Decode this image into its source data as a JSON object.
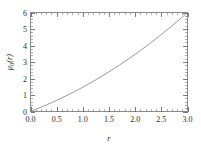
{
  "chart_data": {
    "type": "line",
    "title": "",
    "subtitle": "",
    "xlabel": "r",
    "ylabel": "μ₀(r)",
    "ylabel_base": "μ",
    "ylabel_subscript": "0",
    "ylabel_arg": "(r)",
    "xlim": [
      0,
      3
    ],
    "ylim": [
      0,
      6
    ],
    "grid": false,
    "legend": "none",
    "frame": true,
    "tick_direction": "in",
    "xticks": [
      0,
      0.5,
      1,
      1.5,
      2,
      2.5,
      3
    ],
    "xtick_labels": [
      "0.0",
      "0.5",
      "1.0",
      "1.5",
      "2.0",
      "2.5",
      "3.0"
    ],
    "yticks": [
      0,
      1,
      2,
      3,
      4,
      5,
      6
    ],
    "ytick_labels": [
      "0",
      "1",
      "2",
      "3",
      "4",
      "5",
      "6"
    ],
    "x_minor_per_interval": 5,
    "y_minor_per_interval": 5,
    "series": [
      {
        "name": "mu0",
        "color": "#8c8c8c",
        "x": [
          0.0,
          0.1,
          0.2,
          0.3,
          0.4,
          0.5,
          0.6,
          0.7,
          0.8,
          0.9,
          1.0,
          1.1,
          1.2,
          1.3,
          1.4,
          1.5,
          1.6,
          1.7,
          1.8,
          1.9,
          2.0,
          2.1,
          2.2,
          2.3,
          2.4,
          2.5,
          2.6,
          2.7,
          2.8,
          2.9,
          3.0
        ],
        "y": [
          0.0,
          0.16,
          0.33,
          0.5,
          0.68,
          0.86,
          1.05,
          1.25,
          1.45,
          1.66,
          1.88,
          2.1,
          2.33,
          2.57,
          2.81,
          3.06,
          3.32,
          3.58,
          3.85,
          4.13,
          4.41,
          4.7,
          5.0,
          5.3,
          5.61,
          5.93,
          6.26,
          6.59,
          6.93,
          7.28,
          7.63
        ]
      }
    ],
    "curve_endpoints": {
      "start": [
        0,
        0
      ],
      "end": [
        3,
        6
      ]
    }
  },
  "axes": {
    "x_axis_name": "r",
    "y_axis_name": "mu-zero-of-r"
  }
}
